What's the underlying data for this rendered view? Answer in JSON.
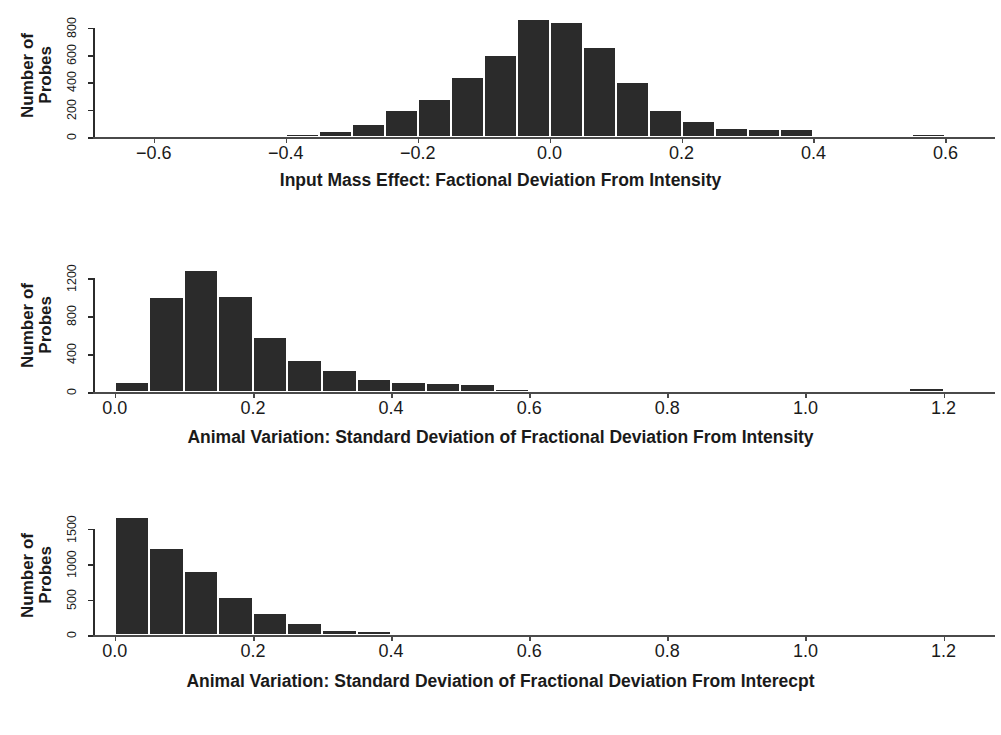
{
  "figure": {
    "background": "#ffffff",
    "bar_color": "#2b2b2b",
    "axis_color": "#4a4a4a"
  },
  "panels": [
    {
      "id": "panel-input-mass-effect",
      "ylabel_line1": "Number of",
      "ylabel_line2": "Probes",
      "xtitle": "Input Mass Effect: Factional Deviation From Intensity",
      "yticks": [
        "0",
        "200",
        "400",
        "600",
        "800"
      ],
      "xticks": [
        "-0.6",
        "-0.4",
        "-0.2",
        "0.0",
        "0.2",
        "0.4",
        "0.6"
      ]
    },
    {
      "id": "panel-animal-variation-intensity",
      "ylabel_line1": "Number of",
      "ylabel_line2": "Probes",
      "xtitle": "Animal Variation: Standard Deviation of Fractional Deviation From Intensity",
      "yticks": [
        "0",
        "400",
        "800",
        "1200"
      ],
      "xticks": [
        "0.0",
        "0.2",
        "0.4",
        "0.6",
        "0.8",
        "1.0",
        "1.2"
      ]
    },
    {
      "id": "panel-animal-variation-intercept",
      "ylabel_line1": "Number of",
      "ylabel_line2": "Probes",
      "xtitle": "Animal Variation: Standard Deviation of Fractional Deviation From Interecpt",
      "yticks": [
        "0",
        "500",
        "1000",
        "1500"
      ],
      "xticks": [
        "0.0",
        "0.2",
        "0.4",
        "0.6",
        "0.8",
        "1.0",
        "1.2"
      ]
    }
  ],
  "chart_data": [
    {
      "type": "bar",
      "title": "",
      "xlabel": "Input Mass Effect: Factional Deviation From Intensity",
      "ylabel": "Number of Probes",
      "xlim": [
        -0.68,
        0.66
      ],
      "ylim": [
        0,
        900
      ],
      "xticks": [
        -0.6,
        -0.4,
        -0.2,
        0.0,
        0.2,
        0.4,
        0.6
      ],
      "xticklabels": [
        "-0.6",
        "-0.4",
        "-0.2",
        "0.0",
        "0.2",
        "0.4",
        "0.6"
      ],
      "yticks": [
        0,
        200,
        400,
        600,
        800
      ],
      "yticklabels": [
        "0",
        "200",
        "400",
        "600",
        "800"
      ],
      "grid": false,
      "legend": null,
      "bin_width": 0.05,
      "bin_edges": [
        -0.4,
        -0.35,
        -0.3,
        -0.25,
        -0.2,
        -0.15,
        -0.1,
        -0.05,
        0.0,
        0.05,
        0.1,
        0.15,
        0.2,
        0.25,
        0.3,
        0.35,
        0.4,
        0.45,
        0.5,
        0.55,
        0.6
      ],
      "bin_centers": [
        -0.375,
        -0.325,
        -0.275,
        -0.225,
        -0.175,
        -0.125,
        -0.075,
        -0.025,
        0.025,
        0.075,
        0.125,
        0.175,
        0.225,
        0.275,
        0.325,
        0.375,
        0.425,
        0.475,
        0.525,
        0.575
      ],
      "values": [
        20,
        45,
        95,
        200,
        280,
        440,
        600,
        860,
        840,
        660,
        400,
        200,
        115,
        65,
        60,
        60,
        15,
        12,
        0,
        25
      ]
    },
    {
      "type": "bar",
      "title": "",
      "xlabel": "Animal Variation: Standard Deviation of Fractional Deviation From Intensity",
      "ylabel": "Number of Probes",
      "xlim": [
        -0.02,
        1.26
      ],
      "ylim": [
        0,
        1320
      ],
      "xticks": [
        0.0,
        0.2,
        0.4,
        0.6,
        0.8,
        1.0,
        1.2
      ],
      "xticklabels": [
        "0.0",
        "0.2",
        "0.4",
        "0.6",
        "0.8",
        "1.0",
        "1.2"
      ],
      "yticks": [
        0,
        400,
        800,
        1200
      ],
      "yticklabels": [
        "0",
        "400",
        "800",
        "1200"
      ],
      "grid": false,
      "legend": null,
      "bin_width": 0.05,
      "bin_edges": [
        0.0,
        0.05,
        0.1,
        0.15,
        0.2,
        0.25,
        0.3,
        0.35,
        0.4,
        0.45,
        0.5,
        0.55,
        0.6,
        0.65,
        0.7,
        1.15,
        1.2
      ],
      "bin_centers": [
        0.025,
        0.075,
        0.125,
        0.175,
        0.225,
        0.275,
        0.325,
        0.375,
        0.425,
        0.475,
        0.525,
        0.575,
        0.625,
        0.675,
        1.175
      ],
      "values": [
        110,
        1000,
        1290,
        1010,
        580,
        340,
        230,
        140,
        110,
        100,
        80,
        35,
        25,
        20,
        45
      ]
    },
    {
      "type": "bar",
      "title": "",
      "xlabel": "Animal Variation: Standard Deviation of Fractional Deviation From Interecpt",
      "ylabel": "Number of Probes",
      "xlim": [
        -0.02,
        1.26
      ],
      "ylim": [
        0,
        1720
      ],
      "xticks": [
        0.0,
        0.2,
        0.4,
        0.6,
        0.8,
        1.0,
        1.2
      ],
      "xticklabels": [
        "0.0",
        "0.2",
        "0.4",
        "0.6",
        "0.8",
        "1.0",
        "1.2"
      ],
      "yticks": [
        0,
        500,
        1000,
        1500
      ],
      "yticklabels": [
        "0",
        "500",
        "1000",
        "1500"
      ],
      "grid": false,
      "legend": null,
      "bin_width": 0.05,
      "bin_edges": [
        0.0,
        0.05,
        0.1,
        0.15,
        0.2,
        0.25,
        0.3,
        0.35,
        0.4,
        0.45,
        0.5
      ],
      "bin_centers": [
        0.025,
        0.075,
        0.125,
        0.175,
        0.225,
        0.275,
        0.325,
        0.375,
        0.425,
        0.475
      ],
      "values": [
        1660,
        1220,
        900,
        540,
        310,
        170,
        75,
        50,
        25,
        18
      ]
    }
  ]
}
